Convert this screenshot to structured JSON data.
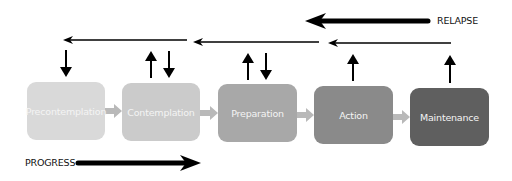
{
  "diagram": {
    "stages": [
      {
        "label": "Precontemplation",
        "color": "#d9d9d9"
      },
      {
        "label": "Contemplation",
        "color": "#cbcbcb"
      },
      {
        "label": "Preparation",
        "color": "#a8a8a8"
      },
      {
        "label": "Action",
        "color": "#8a8a8a"
      },
      {
        "label": "Maintenance",
        "color": "#5f5f5f"
      }
    ],
    "connector_color": "#b9b9b9",
    "relapse_label": "RELAPSE",
    "progress_label": "PROGRESS",
    "vertical_arrows": [
      {
        "stage": "Precontemplation",
        "directions": [
          "down"
        ]
      },
      {
        "stage": "Contemplation",
        "directions": [
          "up",
          "down"
        ]
      },
      {
        "stage": "Preparation",
        "directions": [
          "up",
          "down"
        ]
      },
      {
        "stage": "Action",
        "directions": [
          "up"
        ]
      },
      {
        "stage": "Maintenance",
        "directions": [
          "up"
        ]
      }
    ]
  }
}
